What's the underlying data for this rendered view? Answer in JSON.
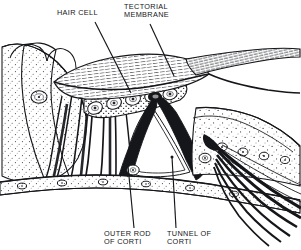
{
  "figure": {
    "background_color": "#ffffff",
    "ink_color": "#15161a",
    "stipple_color": "#3a3c41",
    "width": 301,
    "height": 250
  },
  "labels": {
    "hair_cell": "HAIR CELL",
    "tectorial_membrane": "TECTORIAL\nMEMBRANE",
    "outer_rod_of_corti": "OUTER ROD\nOF CORTI",
    "tunnel_of_corti": "TUNNEL OF\nCORTI"
  },
  "leader_lines": [
    {
      "name": "hair-cell-leader",
      "from": [
        95,
        22
      ],
      "to": [
        131,
        92
      ]
    },
    {
      "name": "tectorial-membrane-leader",
      "from": [
        150,
        24
      ],
      "to": [
        173,
        75
      ]
    },
    {
      "name": "outer-rod-leader",
      "from": [
        134,
        228
      ],
      "to": [
        128,
        166
      ]
    },
    {
      "name": "tunnel-leader",
      "from": [
        176,
        228
      ],
      "to": [
        172,
        157
      ]
    }
  ],
  "structures": [
    {
      "name": "tectorial-membrane",
      "description": "hatched wing-shaped flap extending from center to right edge"
    },
    {
      "name": "hair-cell-row",
      "description": "row of outer hair cells with oval nuclei angled diagonally"
    },
    {
      "name": "tunnel-of-corti",
      "description": "triangular clear space bounded by inner and outer pillar rods"
    },
    {
      "name": "outer-rod-of-corti",
      "description": "thick dark pillar on the outer side of the tunnel"
    },
    {
      "name": "inner-rod-of-corti",
      "description": "thick dark pillar on the inner side of the tunnel"
    },
    {
      "name": "basilar-membrane",
      "description": "horizontal stippled band with oval nuclei along the base"
    },
    {
      "name": "supporting-cells",
      "description": "stippled cellular mass on the left with large nuclei"
    },
    {
      "name": "nerve-fibre-bundle",
      "description": "dark fibres fanning to the lower right"
    },
    {
      "name": "inner-sulcus-cells",
      "description": "pale cell column at the far left"
    }
  ]
}
